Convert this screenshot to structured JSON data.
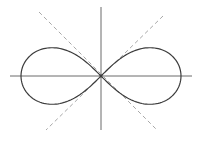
{
  "figure": {
    "colors": {
      "background": "#ffffff",
      "curve": "#3c3c3c",
      "axes": "#6a6a6a",
      "tangents": "#a8a8a8"
    },
    "center": {
      "x": 101,
      "y": 76
    },
    "curve": {
      "a": 80,
      "samples": 240,
      "stroke_width": 1.2
    },
    "axes": {
      "horizontal": {
        "x1": 10,
        "y1": 76,
        "x2": 192,
        "y2": 76
      },
      "vertical": {
        "x1": 101,
        "y1": 7,
        "x2": 101,
        "y2": 130
      }
    },
    "tangents": [
      {
        "name": "tangent-line-negative-slope",
        "x1": 39,
        "y1": 12,
        "x2": 157,
        "y2": 130
      },
      {
        "name": "tangent-line-positive-slope",
        "x1": 163,
        "y1": 16,
        "x2": 46,
        "y2": 130
      }
    ]
  }
}
